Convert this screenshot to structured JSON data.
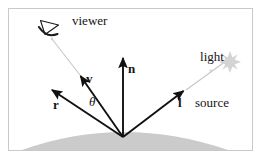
{
  "figure": {
    "background_color": "#ffffff",
    "border_color": "#c9c9c9",
    "vector_color": "#111111",
    "ray_color": "#c6c6c6",
    "surface_color": "#c9c9c9"
  },
  "labels": {
    "viewer": "viewer",
    "light_line1": "light",
    "light_line2": "source",
    "normal": "n",
    "view_vector": "v",
    "reflection_vector": "r",
    "light_vector": "l",
    "angle": "θ"
  },
  "icons": {
    "viewer_icon": "eye-icon",
    "light_source_icon": "star-burst-icon"
  },
  "geometry": {
    "origin": {
      "x": 123,
      "y": 137
    },
    "vectors": [
      {
        "name": "n",
        "tip_x": 123,
        "tip_y": 56,
        "label": "n"
      },
      {
        "name": "v",
        "tip_x": 79,
        "tip_y": 74,
        "label": "v"
      },
      {
        "name": "r",
        "tip_x": 50,
        "tip_y": 88,
        "label": "r"
      },
      {
        "name": "l",
        "tip_x": 185,
        "tip_y": 89,
        "label": "l"
      }
    ],
    "rays": [
      {
        "name": "viewer-ray",
        "from_x": 79,
        "from_y": 74,
        "to_x": 52,
        "to_y": 39
      },
      {
        "name": "light-ray",
        "from_x": 185,
        "from_y": 89,
        "to_x": 224,
        "to_y": 62
      }
    ]
  }
}
